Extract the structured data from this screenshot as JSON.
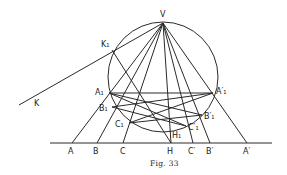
{
  "figure": {
    "caption": "Fig. 33",
    "stroke_color": "#2a2a2a",
    "background": "#ffffff"
  },
  "points": {
    "V": {
      "label": "V",
      "x": 163,
      "y": 23,
      "lx": 160,
      "ly": 17
    },
    "K": {
      "label": "K",
      "x": 19,
      "y": 105,
      "lx": 34,
      "ly": 106
    },
    "K1": {
      "label": "K₁",
      "x": 112,
      "y": 50,
      "lx": 101,
      "ly": 47
    },
    "A1": {
      "label": "A₁",
      "x": 109,
      "y": 93,
      "lx": 95,
      "ly": 95
    },
    "A1p": {
      "label": "A′₁",
      "x": 213,
      "y": 93,
      "lx": 216,
      "ly": 94
    },
    "B1": {
      "label": "B₁",
      "x": 112,
      "y": 107,
      "lx": 99,
      "ly": 111
    },
    "B1p": {
      "label": "B′₁",
      "x": 202,
      "y": 115,
      "lx": 204,
      "ly": 119
    },
    "C1": {
      "label": "C₁",
      "x": 129,
      "y": 123,
      "lx": 115,
      "ly": 127
    },
    "C1p": {
      "label": "C′₁",
      "x": 186,
      "y": 126,
      "lx": 188,
      "ly": 130
    },
    "H1": {
      "label": "H₁",
      "x": 171,
      "y": 132,
      "lx": 172,
      "ly": 138
    },
    "A": {
      "label": "A",
      "x": 72,
      "y": 143,
      "lx": 68,
      "ly": 154
    },
    "B": {
      "label": "B",
      "x": 97,
      "y": 143,
      "lx": 93,
      "ly": 154
    },
    "C": {
      "label": "C",
      "x": 123,
      "y": 143,
      "lx": 120,
      "ly": 154
    },
    "H": {
      "label": "H",
      "x": 171,
      "y": 143,
      "lx": 167,
      "ly": 154
    },
    "Cp": {
      "label": "C′",
      "x": 193,
      "y": 143,
      "lx": 188,
      "ly": 154
    },
    "Bp": {
      "label": "B′",
      "x": 210,
      "y": 143,
      "lx": 206,
      "ly": 154
    },
    "Ap": {
      "label": "A′",
      "x": 247,
      "y": 143,
      "lx": 243,
      "ly": 154
    }
  },
  "circle": {
    "cx": 163,
    "cy": 77,
    "r": 55
  },
  "baseline": {
    "x1": 50,
    "y1": 143,
    "x2": 272,
    "y2": 143
  },
  "segments": [
    [
      "V",
      "A"
    ],
    [
      "V",
      "B"
    ],
    [
      "V",
      "C"
    ],
    [
      "V",
      "H"
    ],
    [
      "V",
      "Cp"
    ],
    [
      "V",
      "Bp"
    ],
    [
      "V",
      "Ap"
    ],
    [
      "K",
      "V"
    ],
    [
      "K1",
      "H"
    ],
    [
      "A1",
      "A1p"
    ],
    [
      "A1",
      "B1p"
    ],
    [
      "A1",
      "C1p"
    ],
    [
      "A1p",
      "B1"
    ],
    [
      "A1p",
      "C1"
    ],
    [
      "B1",
      "C1p"
    ],
    [
      "C1",
      "B1p"
    ]
  ]
}
